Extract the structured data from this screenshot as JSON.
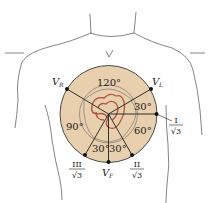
{
  "colors": {
    "disk_fill": "#e8cfae",
    "disk_stroke": "#3a3a3a",
    "heart_stroke": "#b5533f",
    "line": "#1e1e1e",
    "body_outline": "#555555"
  },
  "angles": {
    "top": "120°",
    "upper_right": "30°",
    "right": "60°",
    "left": "90°",
    "bottom_left": "30°",
    "bottom_right": "30°"
  },
  "leads": {
    "vr": {
      "main": "V",
      "sub": "R"
    },
    "vl": {
      "main": "V",
      "sub": "L"
    },
    "vf": {
      "main": "V",
      "sub": "F"
    },
    "lead_i": {
      "num": "I",
      "den": "√3"
    },
    "lead_ii": {
      "num": "II",
      "den": "√3"
    },
    "lead_iii": {
      "num": "III",
      "den": "√3"
    }
  }
}
